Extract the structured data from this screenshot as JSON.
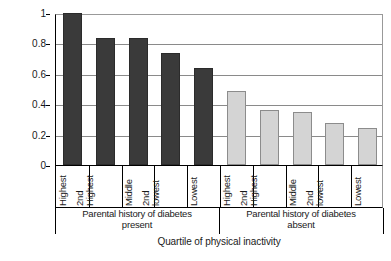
{
  "chart_data": {
    "type": "bar",
    "title": "",
    "xlabel": "Quartile of physical inactivity",
    "ylabel": "Risk of Type 2 Diabetes",
    "ylim": [
      0,
      1
    ],
    "yticks": [
      "0",
      "0.2",
      "0.4",
      "0.6",
      "0.8",
      "1"
    ],
    "grid": true,
    "legend": "none",
    "groups": [
      {
        "name": "Parental history of diabetes present",
        "heading_line1": "Parental history of diabetes",
        "heading_line2": "present",
        "color": "#3a3a3a",
        "categories": [
          "Highest",
          "2nd Highest",
          "Middle",
          "2nd lowest",
          "Lowest"
        ],
        "values": [
          1.0,
          0.835,
          0.835,
          0.74,
          0.635
        ]
      },
      {
        "name": "Parental history of diabetes absent",
        "heading_line1": "Parental history of diabetes",
        "heading_line2": "absent",
        "color": "#d4d4d4",
        "categories": [
          "Highest",
          "2nd Highest",
          "Middle",
          "2nd lowest",
          "Lowest"
        ],
        "values": [
          0.485,
          0.36,
          0.35,
          0.275,
          0.245
        ]
      }
    ],
    "bars": [
      {
        "group": 0,
        "label_line1": "Highest",
        "label_line2": "",
        "value": 1.0,
        "shade": "dark"
      },
      {
        "group": 0,
        "label_line1": "2nd",
        "label_line2": "Highest",
        "value": 0.835,
        "shade": "dark"
      },
      {
        "group": 0,
        "label_line1": "Middle",
        "label_line2": "",
        "value": 0.835,
        "shade": "dark"
      },
      {
        "group": 0,
        "label_line1": "2nd",
        "label_line2": "lowest",
        "value": 0.74,
        "shade": "dark"
      },
      {
        "group": 0,
        "label_line1": "Lowest",
        "label_line2": "",
        "value": 0.635,
        "shade": "dark"
      },
      {
        "group": 1,
        "label_line1": "Highest",
        "label_line2": "",
        "value": 0.485,
        "shade": "light"
      },
      {
        "group": 1,
        "label_line1": "2nd",
        "label_line2": "Highest",
        "value": 0.36,
        "shade": "light"
      },
      {
        "group": 1,
        "label_line1": "Middle",
        "label_line2": "",
        "value": 0.35,
        "shade": "light"
      },
      {
        "group": 1,
        "label_line1": "2nd",
        "label_line2": "lowest",
        "value": 0.275,
        "shade": "light"
      },
      {
        "group": 1,
        "label_line1": "Lowest",
        "label_line2": "",
        "value": 0.245,
        "shade": "light"
      }
    ]
  },
  "axis": {
    "y_title": "Risk of Type 2 Diabetes",
    "x_title": "Quartile of physical inactivity"
  },
  "colors": {
    "bar_dark": "#3a3a3a",
    "bar_light": "#d4d4d4",
    "gridline": "#8a8a8a",
    "axis": "#000000",
    "background": "#ffffff"
  }
}
